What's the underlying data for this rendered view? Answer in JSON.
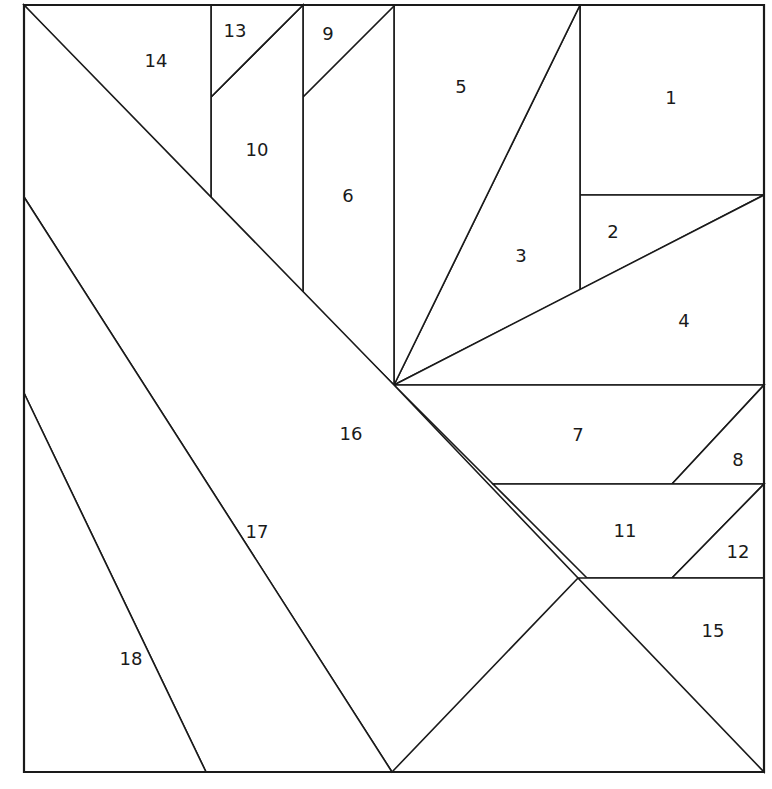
{
  "diagram": {
    "kind": "quilt-block-piecing-diagram",
    "title": "",
    "background_color": "#ffffff",
    "line_color": "#1a1a1a",
    "fill_color": "#ffffff",
    "line_width": 1.6,
    "outline_width": 2.2,
    "label_font_size": 18,
    "canvas": {
      "width": 772,
      "height": 789
    },
    "block_bounds": {
      "left": 24,
      "top": 5,
      "right": 764,
      "bottom": 772
    },
    "fan_center": {
      "x": 394,
      "y": 385
    },
    "piece_count": 18
  },
  "pieces": [
    {
      "number": "1",
      "label_x": 671,
      "label_y": 99,
      "points": "580,5 764,5 764,195 580,195"
    },
    {
      "number": "2",
      "label_x": 613,
      "label_y": 233,
      "points": "580,195 764,195 580,290"
    },
    {
      "number": "3",
      "label_x": 521,
      "label_y": 257,
      "points": "394,385 580,5 580,290"
    },
    {
      "number": "4",
      "label_x": 684,
      "label_y": 322,
      "points": "394,385 764,195 764,385"
    },
    {
      "number": "5",
      "label_x": 461,
      "label_y": 88,
      "points": "394,5 580,5 394,385"
    },
    {
      "number": "6",
      "label_x": 348,
      "label_y": 197,
      "points": "303,5 394,5 394,385 303,294"
    },
    {
      "number": "7",
      "label_x": 578,
      "label_y": 436,
      "points": "394,385 764,385 672,484 493,484"
    },
    {
      "number": "8",
      "label_x": 738,
      "label_y": 461,
      "points": "764,385 764,484 672,484"
    },
    {
      "number": "9",
      "label_x": 328,
      "label_y": 35,
      "points": "303,5 395,5 303,97"
    },
    {
      "number": "10",
      "label_x": 257,
      "label_y": 151,
      "points": "211,97 303,5 303,294 211,202"
    },
    {
      "number": "11",
      "label_x": 625,
      "label_y": 532,
      "points": "493,484 764,484 672,578 587,578"
    },
    {
      "number": "12",
      "label_x": 738,
      "label_y": 553,
      "points": "764,484 764,578 672,578"
    },
    {
      "number": "13",
      "label_x": 235,
      "label_y": 32,
      "points": "211,5 303,5 211,97"
    },
    {
      "number": "14",
      "label_x": 156,
      "label_y": 62,
      "points": "24,5 211,5 211,202"
    },
    {
      "number": "15",
      "label_x": 713,
      "label_y": 632,
      "points": "578,578 764,578 764,772"
    },
    {
      "number": "16",
      "label_x": 351,
      "label_y": 435,
      "points": "24,5 394,385 578,578 392,772 24,197"
    },
    {
      "number": "17",
      "label_x": 257,
      "label_y": 533,
      "points": "24,197 392,772 206,772 24,393"
    },
    {
      "number": "18",
      "label_x": 131,
      "label_y": 660,
      "points": "24,393 206,772 24,772"
    }
  ],
  "block_outline": {
    "points": "24,5 764,5 764,772 24,772"
  }
}
